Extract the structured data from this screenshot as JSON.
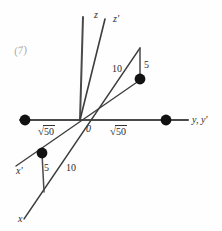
{
  "figure": {
    "kind": "hand-drawn coordinate axes diagram",
    "corner_mark": "(7)",
    "origin_label": "0",
    "axes": [
      {
        "name": "z",
        "label": "z",
        "description": "vertical axis of unprimed frame"
      },
      {
        "name": "z-prime",
        "label": "z'",
        "description": "tilted vertical axis of primed frame"
      },
      {
        "name": "y",
        "label": "y, y'",
        "description": "shared horizontal axis"
      },
      {
        "name": "x",
        "label": "x",
        "description": "axis of unprimed frame toward lower left"
      },
      {
        "name": "x-prime",
        "label": "x'",
        "description": "axis of primed frame toward lower left"
      }
    ],
    "measurements": {
      "left_axis_length": "√50",
      "right_axis_length": "√50",
      "upper_hypotenuse": "10",
      "upper_leg": "5",
      "lower_hypotenuse": "10",
      "lower_leg": "5"
    },
    "radical_value": "50",
    "radical_symbol": "√",
    "points": [
      {
        "name": "point-left-axis",
        "cx": 25,
        "cy": 120
      },
      {
        "name": "point-right-axis",
        "cx": 166,
        "cy": 120
      },
      {
        "name": "point-upper-right",
        "cx": 140,
        "cy": 79
      },
      {
        "name": "point-lower-left",
        "cx": 42,
        "cy": 153
      }
    ],
    "colors": {
      "ink": "#3a3a3a",
      "ink_dark": "#1a1a1a",
      "paper": "#fefefe",
      "faint": "#8c8c8c"
    }
  }
}
